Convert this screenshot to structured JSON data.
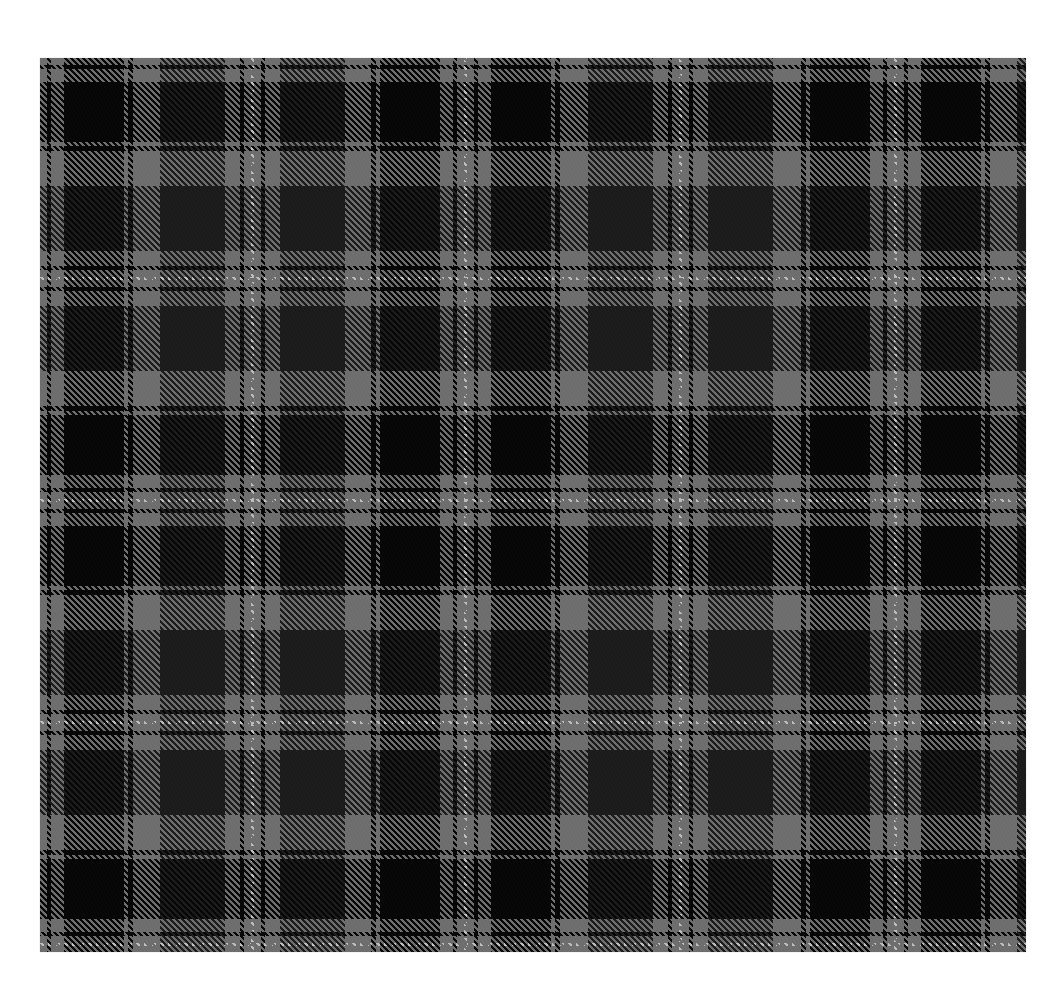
{
  "image": {
    "description": "Grey and black tartan plaid fabric swatch on white background",
    "canvas": {
      "width": 1062,
      "height": 1000,
      "background": "#ffffff"
    },
    "swatch": {
      "x": 40,
      "y": 58,
      "width": 986,
      "height": 894
    }
  },
  "pattern": {
    "name": "grey-black tartan",
    "colors": {
      "gray": "#6e6e6e",
      "black": "#070707",
      "dark": "#1c1c1c",
      "white": "#bdbdbd"
    },
    "twill": {
      "direction": "top-left-to-bottom-right",
      "cycle": 6,
      "warp_share": 3
    },
    "half_sett": {
      "dark_pivot": [
        {
          "color": "white",
          "to": 2
        },
        {
          "color": "gray",
          "to": 9
        },
        {
          "color": "black",
          "to": 13
        },
        {
          "color": "gray",
          "to": 28
        },
        {
          "color": "dark",
          "to": 93
        },
        {
          "color": "gray",
          "to": 108
        }
      ],
      "black_pivot": [
        {
          "color": "white",
          "to": 2
        },
        {
          "color": "gray",
          "to": 9
        },
        {
          "color": "black",
          "to": 13
        },
        {
          "color": "gray",
          "to": 26
        },
        {
          "color": "black",
          "to": 86
        },
        {
          "color": "gray",
          "to": 90
        },
        {
          "color": "black",
          "to": 95
        },
        {
          "color": "gray",
          "to": 108
        }
      ]
    },
    "warp_pivots": [
      {
        "pos": -2,
        "type": "black_pivot"
      },
      {
        "pos": 212,
        "type": "dark_pivot"
      },
      {
        "pos": 425,
        "type": "black_pivot"
      },
      {
        "pos": 640,
        "type": "dark_pivot"
      },
      {
        "pos": 855,
        "type": "black_pivot"
      },
      {
        "pos": 1069,
        "type": "dark_pivot"
      }
    ],
    "weft_pivots": [
      {
        "pos": -2,
        "type": "black_pivot"
      },
      {
        "pos": 220,
        "type": "dark_pivot"
      },
      {
        "pos": 442,
        "type": "black_pivot"
      },
      {
        "pos": 664,
        "type": "dark_pivot"
      },
      {
        "pos": 886,
        "type": "black_pivot"
      }
    ]
  }
}
